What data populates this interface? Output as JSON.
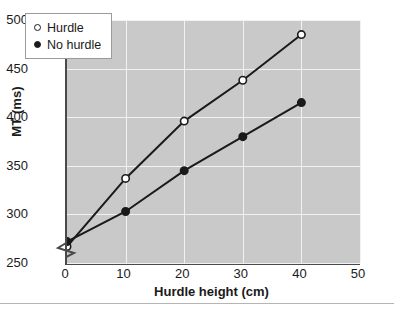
{
  "chart_data": {
    "type": "line",
    "title": "",
    "xlabel": "Hurdle height (cm)",
    "ylabel": "MT (ms)",
    "x": [
      0,
      10,
      20,
      30,
      40
    ],
    "xlim": [
      0,
      50
    ],
    "ylim": [
      250,
      500
    ],
    "xticks": [
      "0",
      "10",
      "20",
      "30",
      "40",
      "50"
    ],
    "yticks": [
      "250",
      "300",
      "350",
      "400",
      "450",
      "500"
    ],
    "grid": true,
    "y_axis_break": true,
    "legend_position": "upper left inside",
    "series": [
      {
        "name": "Hurdle",
        "marker": "open-circle",
        "values": [
          267,
          337,
          396,
          438,
          485
        ]
      },
      {
        "name": "No hurdle",
        "marker": "filled-circle",
        "values": [
          272,
          303,
          345,
          380,
          415
        ]
      }
    ]
  },
  "legend": {
    "items": [
      {
        "label": "Hurdle"
      },
      {
        "label": "No hurdle"
      }
    ]
  },
  "colors": {
    "plot_background": "#c9c9c9",
    "gridline": "#f2f2f2",
    "axis": "#4a4a4a",
    "line": "#1a1a1a",
    "page_background": "#ffffff",
    "legend_background": "#ffffff"
  }
}
